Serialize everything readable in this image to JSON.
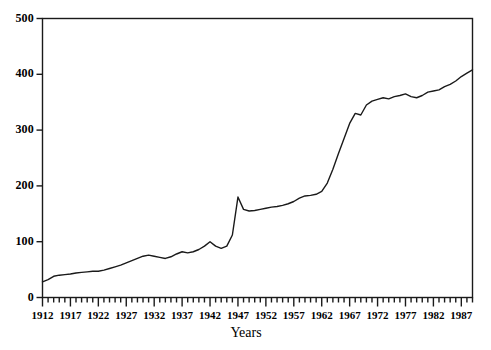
{
  "chart_data": {
    "type": "line",
    "title": "",
    "xlabel": "Years",
    "ylabel": "",
    "xlim": [
      1912,
      1989
    ],
    "ylim": [
      0,
      500
    ],
    "ytick_step": 100,
    "xtick_step": 1,
    "xlabel_step": 5,
    "grid": false,
    "legend": false,
    "frame": "box",
    "line_color": "#1a1a1a",
    "background_color": "#ffffff",
    "yticks": [
      "0",
      "100",
      "200",
      "300",
      "400",
      "500"
    ],
    "xticks": [
      "1912",
      "1917",
      "1922",
      "1927",
      "1932",
      "1937",
      "1942",
      "1947",
      "1952",
      "1957",
      "1962",
      "1967",
      "1972",
      "1977",
      "1982",
      "1987"
    ],
    "x": [
      1912,
      1913,
      1914,
      1915,
      1916,
      1917,
      1918,
      1919,
      1920,
      1921,
      1922,
      1923,
      1924,
      1925,
      1926,
      1927,
      1928,
      1929,
      1930,
      1931,
      1932,
      1933,
      1934,
      1935,
      1936,
      1937,
      1938,
      1939,
      1940,
      1941,
      1942,
      1943,
      1944,
      1945,
      1946,
      1947,
      1948,
      1949,
      1950,
      1951,
      1952,
      1953,
      1954,
      1955,
      1956,
      1957,
      1958,
      1959,
      1960,
      1961,
      1962,
      1963,
      1964,
      1965,
      1966,
      1967,
      1968,
      1969,
      1970,
      1971,
      1972,
      1973,
      1974,
      1975,
      1976,
      1977,
      1978,
      1979,
      1980,
      1981,
      1982,
      1983,
      1984,
      1985,
      1986,
      1987,
      1988,
      1989
    ],
    "values": [
      28,
      32,
      38,
      40,
      41,
      42,
      44,
      45,
      46,
      47,
      47,
      49,
      52,
      55,
      58,
      62,
      66,
      70,
      74,
      76,
      74,
      72,
      70,
      73,
      78,
      82,
      80,
      82,
      86,
      92,
      100,
      92,
      88,
      92,
      112,
      180,
      158,
      155,
      156,
      158,
      160,
      162,
      163,
      165,
      168,
      172,
      178,
      182,
      183,
      185,
      190,
      205,
      230,
      258,
      285,
      312,
      330,
      327,
      345,
      352,
      355,
      358,
      356,
      360,
      362,
      365,
      360,
      358,
      362,
      368,
      370,
      372,
      378,
      382,
      388,
      396,
      402,
      408
    ]
  }
}
